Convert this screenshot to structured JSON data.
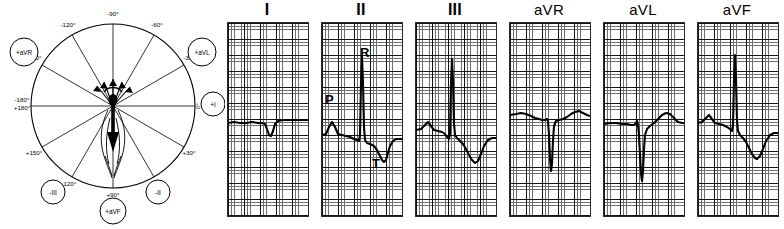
{
  "figure": {
    "background": "#ffffff",
    "trace_color": "#000000",
    "grid_fine_color": "#6f6f6f",
    "grid_coarse_color": "#141414"
  },
  "hexaxial": {
    "name": "hexaxial-reference-circle",
    "axis_degree_labels": [
      {
        "id": "deg-minus-90",
        "text": "-90°",
        "x": 113,
        "y": 16,
        "anchor": "middle"
      },
      {
        "id": "deg-minus-120",
        "text": "-120°",
        "x": 68,
        "y": 27,
        "anchor": "middle"
      },
      {
        "id": "deg-minus-150",
        "text": "-150°",
        "x": 34,
        "y": 60,
        "anchor": "middle"
      },
      {
        "id": "deg-180",
        "text": "-180°",
        "x": 21,
        "y": 102,
        "anchor": "middle"
      },
      {
        "id": "deg-plus-180",
        "text": "+180°",
        "x": 21,
        "y": 110,
        "anchor": "middle"
      },
      {
        "id": "deg-plus-150",
        "text": "+150°",
        "x": 34,
        "y": 152,
        "anchor": "middle"
      },
      {
        "id": "deg-plus-120",
        "text": "+120°",
        "x": 68,
        "y": 184,
        "anchor": "middle"
      },
      {
        "id": "deg-plus-90",
        "text": "+90°",
        "x": 113,
        "y": 196,
        "anchor": "middle"
      },
      {
        "id": "deg-plus-60",
        "text": "+60°",
        "x": 156,
        "y": 184,
        "anchor": "middle"
      },
      {
        "id": "deg-plus-30",
        "text": "+30°",
        "x": 188,
        "y": 152,
        "anchor": "middle"
      },
      {
        "id": "deg-0",
        "text": "0°",
        "x": 200,
        "y": 104,
        "anchor": "middle"
      },
      {
        "id": "deg-minus-30",
        "text": "-30°",
        "x": 188,
        "y": 60,
        "anchor": "middle"
      },
      {
        "id": "deg-minus-60",
        "text": "-60°",
        "x": 156,
        "y": 27,
        "anchor": "middle"
      }
    ],
    "lead_markers": [
      {
        "id": "marker-plus-avr",
        "text": "+aVR",
        "cx": 24,
        "cy": 52,
        "r": 14
      },
      {
        "id": "marker-plus-avl",
        "text": "+aVL",
        "cx": 202,
        "cy": 52,
        "r": 14
      },
      {
        "id": "marker-plus-i",
        "text": "+I",
        "cx": 213,
        "cy": 104,
        "r": 12
      },
      {
        "id": "marker-minus-ii",
        "text": "-II",
        "cx": 158,
        "cy": 192,
        "r": 12
      },
      {
        "id": "marker-plus-avf",
        "text": "+aVF",
        "cx": 113,
        "cy": 211,
        "r": 13
      },
      {
        "id": "marker-minus-iii",
        "text": "-III",
        "cx": 53,
        "cy": 192,
        "r": 12
      }
    ],
    "circle": {
      "cx": 113,
      "cy": 106,
      "r": 82
    },
    "mean_axis_degrees": 90,
    "mean_axis_note": "bold vector arrow directed inferiorly toward +90°"
  },
  "leads": {
    "grid_box": {
      "width": 80,
      "height": 193,
      "top": 22
    },
    "panels": [
      {
        "id": "lead-i",
        "title": "I",
        "title_style": "roman",
        "left": 2,
        "baseline_pct": 51,
        "qrs_polarity": "isoelectric/slightly negative",
        "wave_labels": []
      },
      {
        "id": "lead-ii",
        "title": "II",
        "title_style": "roman",
        "left": 96,
        "baseline_pct": 55,
        "qrs_polarity": "tall positive R",
        "wave_labels": [
          {
            "id": "label-p",
            "text": "P",
            "left": 4,
            "top": 93
          },
          {
            "id": "label-r",
            "text": "R",
            "left": 39,
            "top": 46
          },
          {
            "id": "label-t",
            "text": "T",
            "left": 51,
            "top": 157
          }
        ]
      },
      {
        "id": "lead-iii",
        "title": "III",
        "title_style": "roman",
        "left": 190,
        "baseline_pct": 53,
        "qrs_polarity": "tall positive R, inverted T",
        "wave_labels": []
      },
      {
        "id": "lead-avr",
        "title": "aVR",
        "title_style": "normal",
        "left": 284,
        "baseline_pct": 45,
        "qrs_polarity": "deep negative QS",
        "wave_labels": []
      },
      {
        "id": "lead-avl",
        "title": "aVL",
        "title_style": "normal",
        "left": 378,
        "baseline_pct": 49,
        "qrs_polarity": "deep negative S, upright T",
        "wave_labels": []
      },
      {
        "id": "lead-avf",
        "title": "aVF",
        "title_style": "normal",
        "left": 472,
        "baseline_pct": 47,
        "qrs_polarity": "tall positive R, inverted T",
        "wave_labels": []
      }
    ]
  },
  "traces": {
    "lead-i": "M0,100 L6,99 L12,100 L18,100 L24,99 L30,100 L34,100 L37,101 L39,106 L41,112 L43,113 L45,108 L47,101 L50,98 L55,97 L62,97 L70,97 L80,97",
    "lead-ii": "M0,112 L4,111 L7,104 L10,99 L13,104 L16,111 L20,112 L24,113 L28,114 L32,116 L35,117 L37,118 L38,112 L39,60 L40,34 L41,60 L42,104 L43,117 L45,120 L48,121 L52,123 L55,127 L58,133 L60,137 L62,139 L64,137 L66,130 L68,123 L71,118 L74,116 L78,116 L80,116",
    "lead-iii": "M0,107 L5,106 L9,102 L12,99 L15,103 L18,107 L22,108 L26,109 L29,111 L31,114 L33,116 L34,110 L35,60 L36,36 L37,58 L38,100 L39,112 L41,115 L44,118 L47,121 L50,126 L53,132 L56,137 L59,140 L62,138 L65,131 L68,123 L72,117 L76,115 L80,115",
    "lead-avr": "M0,92 L6,91 L11,90 L16,91 L21,93 L25,95 L29,96 L32,97 L35,97 L37,96 L38,98 L39,112 L40,135 L41,148 L42,140 L43,118 L44,103 L46,98 L49,97 L53,96 L57,94 L61,91 L65,89 L69,88 L73,90 L77,92 L80,93",
    "lead-avl": "M0,101 L6,100 L12,100 L18,101 L23,101 L27,102 L30,102 L32,100 L33,98 L34,102 L35,112 L36,132 L37,150 L38,158 L39,148 L40,126 L41,112 L43,106 L46,103 L50,100 L54,96 L58,92 L62,90 L66,91 L70,95 L74,99 L78,100 L80,100",
    "lead-avf": "M0,100 L4,99 L8,95 L11,92 L14,96 L17,100 L21,101 L25,102 L29,104 L32,106 L34,108 L35,102 L36,56 L37,32 L38,56 L39,98 L40,108 L42,112 L45,115 L48,119 L51,125 L54,131 L57,135 L59,136 L62,133 L65,126 L68,118 L72,112 L76,110 L80,110"
  }
}
